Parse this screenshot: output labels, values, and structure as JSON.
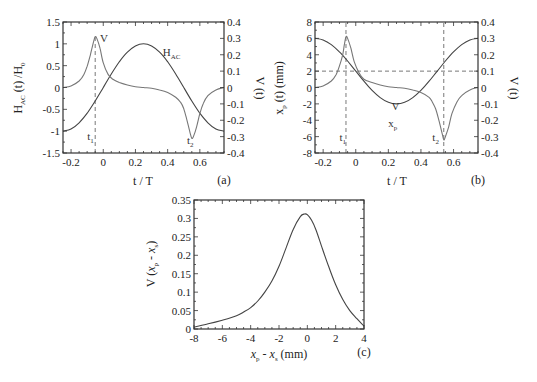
{
  "chart_data": [
    {
      "panel": "a",
      "type": "line",
      "panel_label": "(a)",
      "xlabel": "t / T",
      "ylabel_left": "H_AC (t) /H_0",
      "ylabel_right": "V (t)",
      "xlim": [
        -0.25,
        0.75
      ],
      "ylim_left": [
        -1.5,
        1.5
      ],
      "ylim_right": [
        -0.4,
        0.4
      ],
      "xticks": [
        -0.2,
        0,
        0.2,
        0.4,
        0.6
      ],
      "yticks_left": [
        -1.5,
        -1,
        -0.5,
        0,
        0.5,
        1,
        1.5
      ],
      "yticks_right": [
        -0.4,
        -0.3,
        -0.2,
        -0.1,
        0,
        0.1,
        0.2,
        0.3,
        0.4
      ],
      "annotations": [
        {
          "text": "V",
          "x": -0.02,
          "y_right": 0.28
        },
        {
          "text": "H_AC",
          "x": 0.37,
          "y_left": 0.72
        },
        {
          "text": "t_1",
          "x": -0.1,
          "y_left": -1.2
        },
        {
          "text": "t_2",
          "x": 0.52,
          "y_left": -1.3
        }
      ],
      "vlines": [
        {
          "x": -0.05,
          "style": "dashed",
          "from_y_left": -1.5,
          "to_y_left": 1.15
        }
      ],
      "series": [
        {
          "name": "H_AC",
          "axis": "left",
          "x": [
            -0.25,
            -0.2,
            -0.15,
            -0.1,
            -0.05,
            0,
            0.05,
            0.1,
            0.15,
            0.2,
            0.25,
            0.3,
            0.35,
            0.4,
            0.45,
            0.5,
            0.55,
            0.6,
            0.65,
            0.7,
            0.75
          ],
          "y": [
            -1,
            -0.951,
            -0.809,
            -0.588,
            -0.309,
            0,
            0.309,
            0.588,
            0.809,
            0.951,
            1,
            0.951,
            0.809,
            0.588,
            0.309,
            0,
            -0.309,
            -0.588,
            -0.809,
            -0.951,
            -1
          ]
        },
        {
          "name": "V",
          "axis": "right",
          "x": [
            -0.25,
            -0.2,
            -0.15,
            -0.12,
            -0.1,
            -0.08,
            -0.06,
            -0.05,
            -0.04,
            -0.02,
            0,
            0.03,
            0.06,
            0.1,
            0.15,
            0.2,
            0.25,
            0.3,
            0.35,
            0.4,
            0.45,
            0.48,
            0.5,
            0.52,
            0.54,
            0.55,
            0.56,
            0.58,
            0.6,
            0.62,
            0.65,
            0.7,
            0.75
          ],
          "y": [
            0,
            0.01,
            0.04,
            0.08,
            0.13,
            0.2,
            0.28,
            0.31,
            0.3,
            0.24,
            0.15,
            0.08,
            0.05,
            0.03,
            0.015,
            0.005,
            0,
            -0.005,
            -0.015,
            -0.03,
            -0.06,
            -0.09,
            -0.13,
            -0.2,
            -0.28,
            -0.31,
            -0.3,
            -0.24,
            -0.16,
            -0.1,
            -0.05,
            -0.015,
            0
          ]
        }
      ]
    },
    {
      "panel": "b",
      "type": "line",
      "panel_label": "(b)",
      "xlabel": "t / T",
      "ylabel_left": "x_p (t) (mm)",
      "ylabel_right": "V (t)",
      "xlim": [
        -0.25,
        0.75
      ],
      "ylim_left": [
        -8,
        8
      ],
      "ylim_right": [
        -0.4,
        0.4
      ],
      "xticks": [
        -0.2,
        0,
        0.2,
        0.4,
        0.6
      ],
      "yticks_left": [
        -8,
        -6,
        -4,
        -2,
        0,
        2,
        4,
        6,
        8
      ],
      "yticks_right": [
        -0.4,
        -0.3,
        -0.2,
        -0.1,
        0,
        0.1,
        0.2,
        0.3,
        0.4
      ],
      "annotations": [
        {
          "text": "V",
          "x": 0.22,
          "y_left": -2.8
        },
        {
          "text": "x_p",
          "x": 0.2,
          "y_left": -4.8
        },
        {
          "text": "t_1",
          "x": -0.1,
          "y_left": -6.5
        },
        {
          "text": "t_2",
          "x": 0.47,
          "y_left": -6.5
        }
      ],
      "hlines": [
        {
          "y_left": 2,
          "style": "dashed"
        }
      ],
      "vlines": [
        {
          "x": -0.06,
          "style": "dashed"
        },
        {
          "x": 0.54,
          "style": "dashed"
        }
      ],
      "series": [
        {
          "name": "x_p",
          "axis": "left",
          "x": [
            -0.25,
            -0.2,
            -0.15,
            -0.1,
            -0.05,
            0,
            0.05,
            0.1,
            0.15,
            0.2,
            0.25,
            0.3,
            0.35,
            0.4,
            0.45,
            0.5,
            0.55,
            0.6,
            0.65,
            0.7,
            0.75
          ],
          "y": [
            6,
            5.809,
            5.236,
            4.351,
            3.236,
            2,
            0.764,
            -0.351,
            -1.236,
            -1.809,
            -2,
            -1.809,
            -1.236,
            -0.351,
            0.764,
            2,
            3.236,
            4.351,
            5.236,
            5.809,
            6
          ]
        },
        {
          "name": "V",
          "axis": "right",
          "x": [
            -0.25,
            -0.2,
            -0.15,
            -0.12,
            -0.1,
            -0.08,
            -0.07,
            -0.06,
            -0.05,
            -0.03,
            -0.01,
            0.02,
            0.05,
            0.1,
            0.15,
            0.2,
            0.25,
            0.3,
            0.35,
            0.4,
            0.45,
            0.47,
            0.49,
            0.51,
            0.53,
            0.54,
            0.55,
            0.57,
            0.59,
            0.62,
            0.65,
            0.7,
            0.75
          ],
          "y": [
            0,
            0.01,
            0.04,
            0.08,
            0.13,
            0.2,
            0.26,
            0.31,
            0.3,
            0.24,
            0.16,
            0.09,
            0.05,
            0.03,
            0.015,
            0.005,
            0,
            -0.005,
            -0.015,
            -0.03,
            -0.06,
            -0.09,
            -0.13,
            -0.2,
            -0.28,
            -0.32,
            -0.3,
            -0.24,
            -0.16,
            -0.09,
            -0.05,
            -0.015,
            0
          ]
        }
      ]
    },
    {
      "panel": "c",
      "type": "line",
      "panel_label": "(c)",
      "xlabel": "x_p - x_s (mm)",
      "ylabel": "V (x_p - x_s)",
      "xlim": [
        -8,
        4
      ],
      "ylim": [
        0,
        0.35
      ],
      "xticks": [
        -8,
        -6,
        -4,
        -2,
        0,
        2,
        4
      ],
      "yticks": [
        0,
        0.05,
        0.1,
        0.15,
        0.2,
        0.25,
        0.3,
        0.35
      ],
      "series": [
        {
          "name": "V",
          "x": [
            -8,
            -7,
            -6,
            -5,
            -4.5,
            -4,
            -3.5,
            -3,
            -2.5,
            -2,
            -1.5,
            -1,
            -0.5,
            -0.2,
            0,
            0.3,
            0.6,
            1,
            1.5,
            2,
            2.5,
            3,
            3.5,
            4
          ],
          "y": [
            0.005,
            0.014,
            0.024,
            0.036,
            0.046,
            0.058,
            0.076,
            0.1,
            0.13,
            0.17,
            0.22,
            0.27,
            0.305,
            0.312,
            0.31,
            0.295,
            0.27,
            0.225,
            0.17,
            0.12,
            0.08,
            0.05,
            0.028,
            0.008
          ]
        }
      ]
    }
  ]
}
